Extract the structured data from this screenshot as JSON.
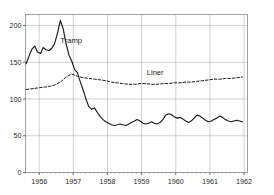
{
  "chart_data": {
    "type": "line",
    "title": "",
    "subtitle": "",
    "xlabel": "",
    "ylabel": "",
    "grid": true,
    "legend_position": "inline-annotation",
    "xlim": [
      1955.6,
      1962.1
    ],
    "ylim": [
      0,
      215
    ],
    "x_ticks": [
      "1956",
      "1957",
      "1958",
      "1959",
      "1960",
      "1961",
      "1962"
    ],
    "x_tick_values": [
      1956,
      1957,
      1958,
      1959,
      1960,
      1961,
      1962
    ],
    "y_ticks": [
      "0",
      "50",
      "100",
      "150",
      "200"
    ],
    "y_tick_values": [
      0,
      50,
      100,
      150,
      200
    ],
    "annotations": [
      {
        "text": "Tramp",
        "x": 1956.62,
        "y": 176,
        "name": "tramp-label"
      },
      {
        "text": "Liner",
        "x": 1959.15,
        "y": 132,
        "name": "liner-label"
      }
    ],
    "series": [
      {
        "name": "Tramp",
        "style": "solid",
        "color": "#1a1a1a",
        "x": [
          1955.62,
          1955.7,
          1955.79,
          1955.87,
          1955.95,
          1956.04,
          1956.12,
          1956.2,
          1956.29,
          1956.37,
          1956.45,
          1956.54,
          1956.62,
          1956.7,
          1956.79,
          1956.87,
          1956.95,
          1957.04,
          1957.12,
          1957.2,
          1957.29,
          1957.37,
          1957.45,
          1957.54,
          1957.62,
          1957.7,
          1957.79,
          1957.87,
          1957.95,
          1958.04,
          1958.12,
          1958.2,
          1958.29,
          1958.37,
          1958.45,
          1958.54,
          1958.62,
          1958.7,
          1958.79,
          1958.87,
          1958.95,
          1959.04,
          1959.12,
          1959.2,
          1959.29,
          1959.37,
          1959.45,
          1959.54,
          1959.62,
          1959.7,
          1959.79,
          1959.87,
          1959.95,
          1960.04,
          1960.12,
          1960.2,
          1960.29,
          1960.37,
          1960.45,
          1960.54,
          1960.62,
          1960.7,
          1960.79,
          1960.87,
          1960.95,
          1961.04,
          1961.12,
          1961.2,
          1961.29,
          1961.37,
          1961.45,
          1961.54,
          1961.62,
          1961.7,
          1961.79,
          1961.87,
          1961.95
        ],
        "y": [
          148,
          158,
          168,
          172,
          164,
          162,
          170,
          167,
          166,
          169,
          175,
          190,
          207,
          196,
          175,
          160,
          152,
          140,
          136,
          124,
          112,
          100,
          90,
          86,
          88,
          82,
          76,
          72,
          69,
          67,
          65,
          64,
          65,
          66,
          65,
          64,
          66,
          68,
          70,
          72,
          70,
          67,
          66,
          67,
          69,
          67,
          66,
          68,
          72,
          78,
          80,
          79,
          76,
          74,
          75,
          73,
          70,
          68,
          70,
          74,
          78,
          77,
          74,
          71,
          69,
          70,
          72,
          74,
          77,
          75,
          72,
          70,
          69,
          70,
          71,
          70,
          69
        ]
      },
      {
        "name": "Liner",
        "style": "dashed",
        "color": "#1a1a1a",
        "x": [
          1955.62,
          1955.79,
          1955.95,
          1956.12,
          1956.29,
          1956.45,
          1956.62,
          1956.79,
          1956.95,
          1957.12,
          1957.29,
          1957.45,
          1957.62,
          1957.79,
          1957.95,
          1958.12,
          1958.29,
          1958.45,
          1958.62,
          1958.79,
          1958.95,
          1959.12,
          1959.29,
          1959.45,
          1959.62,
          1959.79,
          1959.95,
          1960.12,
          1960.29,
          1960.45,
          1960.62,
          1960.79,
          1960.95,
          1961.12,
          1961.29,
          1961.45,
          1961.62,
          1961.79,
          1961.95
        ],
        "y": [
          113,
          114,
          115,
          116,
          117,
          119,
          123,
          130,
          134,
          131,
          129,
          128,
          127,
          126,
          125,
          123,
          122,
          121,
          120,
          120,
          121,
          121,
          120,
          120,
          121,
          121,
          122,
          122,
          123,
          123,
          124,
          125,
          126,
          127,
          127,
          128,
          128,
          129,
          130
        ]
      }
    ]
  }
}
